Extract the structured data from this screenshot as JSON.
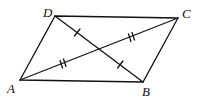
{
  "diagram": {
    "vertices": [
      {
        "label": "A",
        "x": 20,
        "y": 80,
        "lx": 7,
        "ly": 93
      },
      {
        "label": "B",
        "x": 143,
        "y": 82,
        "lx": 142,
        "ly": 95
      },
      {
        "label": "C",
        "x": 178,
        "y": 18,
        "lx": 182,
        "ly": 18
      },
      {
        "label": "D",
        "x": 55,
        "y": 16,
        "lx": 44,
        "ly": 17
      }
    ],
    "sides": [
      "AB",
      "BC",
      "CD",
      "DA"
    ],
    "diagonals": [
      {
        "name": "AC",
        "tick_marks": 2
      },
      {
        "name": "DB",
        "tick_marks": 1
      }
    ],
    "stroke_color": "#111111"
  }
}
